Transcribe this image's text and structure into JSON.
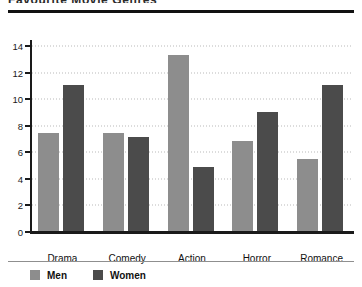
{
  "chart_data": {
    "type": "bar",
    "title": "Favourite Movie Genres",
    "xlabel": "",
    "ylabel": "",
    "categories": [
      "Drama",
      "Comedy",
      "Action",
      "Horror",
      "Romance"
    ],
    "series": [
      {
        "name": "Men",
        "color": "#8d8d8d",
        "values": [
          7.4,
          7.4,
          13.3,
          6.8,
          5.4
        ]
      },
      {
        "name": "Women",
        "color": "#4b4b4b",
        "values": [
          11.0,
          7.1,
          4.8,
          9.0,
          11.0
        ]
      }
    ],
    "ylim": [
      0,
      15
    ],
    "yticks": [
      0,
      2,
      4,
      6,
      8,
      10,
      12,
      14
    ],
    "ytick_labels": [
      "0",
      "2",
      "4",
      "6",
      "8",
      "10",
      "12",
      "14"
    ],
    "grid": true,
    "grid_style": "dotted-horizontal",
    "legend_position": "bottom-left"
  }
}
